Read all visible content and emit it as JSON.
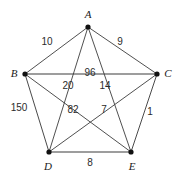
{
  "figure": {
    "name": "complete-graph-k5",
    "background_color": "#ffffff",
    "edge_color": "#3c3c3c",
    "outer_edge_color": "#7d7d7d",
    "vertex_color": "#111111",
    "width": 177,
    "height": 176
  },
  "vertices": [
    {
      "id": "A",
      "label": "A",
      "x": 88,
      "y": 27,
      "label_x": 88,
      "label_y": 14
    },
    {
      "id": "B",
      "label": "B",
      "x": 25,
      "y": 74,
      "label_x": 14,
      "label_y": 73
    },
    {
      "id": "C",
      "label": "C",
      "x": 157,
      "y": 74,
      "label_x": 168,
      "label_y": 73
    },
    {
      "id": "D",
      "label": "D",
      "x": 49,
      "y": 152,
      "label_x": 48,
      "label_y": 166
    },
    {
      "id": "E",
      "label": "E",
      "x": 131,
      "y": 152,
      "label_x": 132,
      "label_y": 166
    }
  ],
  "edges": [
    {
      "from": "A",
      "to": "B",
      "weight": "10",
      "label_x": 47,
      "label_y": 42,
      "style": "inner"
    },
    {
      "from": "A",
      "to": "C",
      "weight": "9",
      "label_x": 120,
      "label_y": 42,
      "style": "inner"
    },
    {
      "from": "B",
      "to": "C",
      "weight": "96",
      "label_x": 90,
      "label_y": 73,
      "style": "outer"
    },
    {
      "from": "A",
      "to": "D",
      "weight": "20",
      "label_x": 68,
      "label_y": 86,
      "style": "inner"
    },
    {
      "from": "A",
      "to": "E",
      "weight": "14",
      "label_x": 105,
      "label_y": 86,
      "style": "inner"
    },
    {
      "from": "B",
      "to": "D",
      "weight": "150",
      "label_x": 19,
      "label_y": 108,
      "style": "outer-dark"
    },
    {
      "from": "B",
      "to": "E",
      "weight": "82",
      "label_x": 73,
      "label_y": 110,
      "style": "inner"
    },
    {
      "from": "C",
      "to": "D",
      "weight": "7",
      "label_x": 104,
      "label_y": 110,
      "style": "inner"
    },
    {
      "from": "C",
      "to": "E",
      "weight": "1",
      "label_x": 150,
      "label_y": 112,
      "style": "outer-dark"
    },
    {
      "from": "D",
      "to": "E",
      "weight": "8",
      "label_x": 90,
      "label_y": 163,
      "style": "outer"
    }
  ]
}
